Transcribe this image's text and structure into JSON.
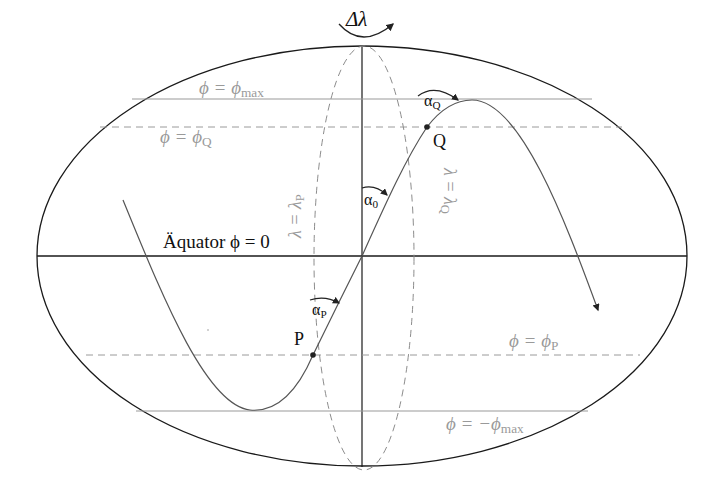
{
  "diagram": {
    "labels": {
      "delta_lambda": "Δλ",
      "phi_max": {
        "lhs": "ϕ = ϕ",
        "sub": "max"
      },
      "phi_q": {
        "lhs": "ϕ = ϕ",
        "sub": "Q"
      },
      "phi_p": {
        "lhs": "ϕ = ϕ",
        "sub": "P"
      },
      "phi_min": {
        "lhs": "ϕ = −ϕ",
        "sub": "max"
      },
      "equator": "Äquator ϕ = 0",
      "lambda_p": {
        "lhs": "λ = λ",
        "sub": "P"
      },
      "lambda_q": {
        "lhs": "λ = λ",
        "sub": "Q"
      },
      "alpha_0": {
        "sym": "α",
        "sub": "0"
      },
      "alpha_p": {
        "sym": "α",
        "sub": "P"
      },
      "alpha_q": {
        "sym": "α",
        "sub": "Q"
      },
      "point_p": "P",
      "point_q": "Q"
    },
    "colors": {
      "outline": "#1a1a1a",
      "curve": "#555555",
      "grey_line": "#9a9a9a",
      "dashed": "#8c8c8c",
      "label_grey": "#9a9a9a",
      "label_dark": "#111111"
    },
    "geometry": {
      "ellipse": {
        "cx": 362,
        "cy": 256,
        "rx": 325,
        "ry": 210
      },
      "equator_y": 256,
      "axis_x": 362,
      "phi_max_y": 99,
      "phi_q_y": 127,
      "phi_p_y": 355,
      "phi_min_y": 411,
      "meridian": {
        "cx": 364,
        "cy": 258,
        "rx": 50,
        "ry": 212
      },
      "points": {
        "P": [
          313,
          355
        ],
        "Q": [
          427,
          127
        ]
      }
    }
  }
}
